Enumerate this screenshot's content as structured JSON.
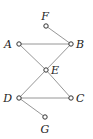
{
  "diagram": {
    "type": "graph",
    "nodes": [
      {
        "id": "F",
        "label": "F",
        "x": 46,
        "y": 26,
        "lx": 45,
        "ly": 20,
        "anchor": "middle"
      },
      {
        "id": "A",
        "label": "A",
        "x": 19,
        "y": 44,
        "lx": 12,
        "ly": 48,
        "anchor": "end"
      },
      {
        "id": "B",
        "label": "B",
        "x": 71,
        "y": 44,
        "lx": 76,
        "ly": 48,
        "anchor": "start"
      },
      {
        "id": "E",
        "label": "E",
        "x": 46,
        "y": 70,
        "lx": 51,
        "ly": 74,
        "anchor": "start"
      },
      {
        "id": "D",
        "label": "D",
        "x": 19,
        "y": 98,
        "lx": 12,
        "ly": 102,
        "anchor": "end"
      },
      {
        "id": "C",
        "label": "C",
        "x": 71,
        "y": 98,
        "lx": 76,
        "ly": 102,
        "anchor": "start"
      },
      {
        "id": "G",
        "label": "G",
        "x": 45,
        "y": 117,
        "lx": 45,
        "ly": 133,
        "anchor": "middle"
      }
    ],
    "edges": [
      {
        "from": "F",
        "to": "B"
      },
      {
        "from": "A",
        "to": "B"
      },
      {
        "from": "A",
        "to": "E"
      },
      {
        "from": "E",
        "to": "C"
      },
      {
        "from": "B",
        "to": "E"
      },
      {
        "from": "E",
        "to": "D"
      },
      {
        "from": "D",
        "to": "C"
      },
      {
        "from": "D",
        "to": "G"
      }
    ],
    "colors": {
      "edge": "#8a8a8a",
      "node_stroke": "#333333",
      "label": "#222222"
    }
  }
}
